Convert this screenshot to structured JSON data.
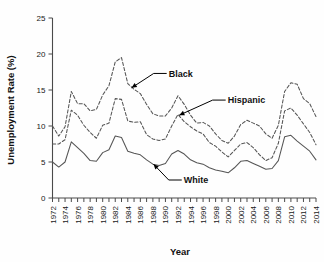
{
  "chart_data": {
    "type": "line",
    "title": "",
    "xlabel": "Year",
    "ylabel": "Unemployment Rate (%)",
    "xlim": [
      1972,
      2014
    ],
    "ylim": [
      0,
      25
    ],
    "yticks": [
      0,
      5,
      10,
      15,
      20,
      25
    ],
    "ytick_labels": [
      "0",
      "5",
      "10",
      "15",
      "20",
      "25"
    ],
    "xticks": [
      1972,
      1973,
      1974,
      1975,
      1976,
      1977,
      1978,
      1979,
      1980,
      1981,
      1982,
      1983,
      1984,
      1985,
      1986,
      1987,
      1988,
      1989,
      1990,
      1991,
      1992,
      1993,
      1994,
      1995,
      1996,
      1997,
      1998,
      1999,
      2000,
      2001,
      2002,
      2003,
      2004,
      2005,
      2006,
      2007,
      2008,
      2009,
      2010,
      2011,
      2012,
      2013,
      2014
    ],
    "xtick_labels": [
      "1972",
      "1974",
      "1976",
      "1978",
      "1980",
      "1982",
      "1984",
      "1986",
      "1988",
      "1990",
      "1992",
      "1994",
      "1996",
      "1998",
      "2000",
      "2002",
      "2004",
      "2006",
      "2008",
      "2010",
      "2012",
      "2014"
    ],
    "xtick_label_years": [
      1972,
      1974,
      1976,
      1978,
      1980,
      1982,
      1984,
      1986,
      1988,
      1990,
      1992,
      1994,
      1996,
      1998,
      2000,
      2002,
      2004,
      2006,
      2008,
      2010,
      2012,
      2014
    ],
    "grid": false,
    "legend": "inline-annotations",
    "x": [
      1972,
      1973,
      1974,
      1975,
      1976,
      1977,
      1978,
      1979,
      1980,
      1981,
      1982,
      1983,
      1984,
      1985,
      1986,
      1987,
      1988,
      1989,
      1990,
      1991,
      1992,
      1993,
      1994,
      1995,
      1996,
      1997,
      1998,
      1999,
      2000,
      2001,
      2002,
      2003,
      2004,
      2005,
      2006,
      2007,
      2008,
      2009,
      2010,
      2011,
      2012,
      2013,
      2014
    ],
    "series": [
      {
        "name": "Black",
        "style": "dashed",
        "color": "#555555",
        "values": [
          10.0,
          8.6,
          9.9,
          14.8,
          13.1,
          13.1,
          12.1,
          12.3,
          14.3,
          15.6,
          18.9,
          19.5,
          15.9,
          15.1,
          14.5,
          13.0,
          11.7,
          11.4,
          11.4,
          12.5,
          14.2,
          13.0,
          11.5,
          10.4,
          10.5,
          10.0,
          8.9,
          8.0,
          7.6,
          8.6,
          10.2,
          10.8,
          10.4,
          10.0,
          8.9,
          8.3,
          10.1,
          14.8,
          16.0,
          15.8,
          13.8,
          13.1,
          11.3
        ]
      },
      {
        "name": "Hispanic",
        "style": "dashed",
        "color": "#555555",
        "values": [
          7.5,
          7.5,
          8.1,
          12.2,
          11.5,
          10.1,
          9.1,
          8.3,
          10.1,
          10.4,
          13.8,
          13.7,
          10.7,
          10.5,
          10.6,
          8.8,
          8.2,
          8.0,
          8.2,
          10.0,
          11.6,
          10.6,
          9.9,
          9.3,
          8.9,
          7.7,
          7.2,
          6.4,
          5.7,
          6.6,
          7.5,
          7.7,
          7.0,
          6.0,
          5.2,
          5.6,
          7.6,
          12.1,
          12.5,
          11.5,
          10.3,
          9.1,
          7.4
        ]
      },
      {
        "name": "White",
        "style": "solid",
        "color": "#555555",
        "values": [
          5.0,
          4.3,
          5.0,
          7.8,
          7.0,
          6.2,
          5.2,
          5.1,
          6.3,
          6.7,
          8.6,
          8.4,
          6.5,
          6.2,
          6.0,
          5.3,
          4.7,
          4.5,
          4.8,
          6.1,
          6.6,
          6.1,
          5.3,
          4.9,
          4.7,
          4.2,
          3.9,
          3.7,
          3.5,
          4.2,
          5.1,
          5.2,
          4.8,
          4.4,
          4.0,
          4.1,
          5.2,
          8.5,
          8.7,
          7.9,
          7.2,
          6.5,
          5.3
        ]
      }
    ],
    "annotations": [
      {
        "label": "Black",
        "series": "Black",
        "target_x": 1984.6,
        "target_y": 15.3,
        "text_x": 1990.2,
        "text_y": 17.3
      },
      {
        "label": "Hispanic",
        "series": "Hispanic",
        "target_x": 1992.2,
        "target_y": 11.5,
        "text_x": 1999.6,
        "text_y": 13.6
      },
      {
        "label": "White",
        "series": "White",
        "target_x": 1988.1,
        "target_y": 4.7,
        "text_x": 1992.6,
        "text_y": 2.5
      }
    ]
  }
}
